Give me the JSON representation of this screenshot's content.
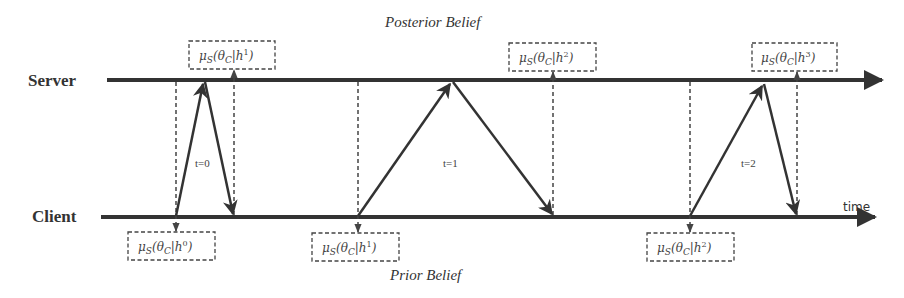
{
  "diagram": {
    "title_top": "Posterior Belief",
    "title_bottom": "Prior Belief",
    "lanes": {
      "server": "Server",
      "client": "Client"
    },
    "axis_label": "time",
    "rounds": [
      {
        "label": "t=0"
      },
      {
        "label": "t=1"
      },
      {
        "label": "t=2"
      }
    ],
    "posterior_boxes": [
      {
        "mu": "μ",
        "mu_sub": "S",
        "theta": "θ",
        "theta_sub": "C",
        "h": "h",
        "h_sup": "1"
      },
      {
        "mu": "μ",
        "mu_sub": "S",
        "theta": "θ",
        "theta_sub": "C",
        "h": "h",
        "h_sup": "2"
      },
      {
        "mu": "μ",
        "mu_sub": "S",
        "theta": "θ",
        "theta_sub": "C",
        "h": "h",
        "h_sup": "3"
      }
    ],
    "prior_boxes": [
      {
        "mu": "μ",
        "mu_sub": "S",
        "theta": "θ",
        "theta_sub": "C",
        "h": "h",
        "h_sup": "0"
      },
      {
        "mu": "μ",
        "mu_sub": "S",
        "theta": "θ",
        "theta_sub": "C",
        "h": "h",
        "h_sup": "1"
      },
      {
        "mu": "μ",
        "mu_sub": "S",
        "theta": "θ",
        "theta_sub": "C",
        "h": "h",
        "h_sup": "2"
      }
    ],
    "colors": {
      "line": "#333333",
      "dashed": "#444444",
      "text": "#333333"
    }
  }
}
